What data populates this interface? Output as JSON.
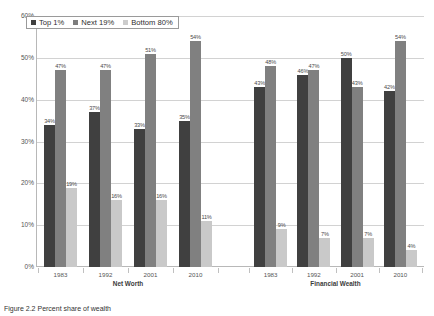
{
  "chart_data": {
    "type": "bar",
    "title": "",
    "xlabel": "",
    "ylabel": "",
    "ylim": [
      0,
      60
    ],
    "grid": true,
    "legend_position": "top-left",
    "yticks": [
      "0%",
      "10%",
      "20%",
      "30%",
      "40%",
      "50%",
      "60%"
    ],
    "ytick_values": [
      0,
      10,
      20,
      30,
      40,
      50,
      60
    ],
    "legend": [
      "Top 1%",
      "Next 19%",
      "Bottom 80%"
    ],
    "groups": [
      {
        "name": "Net Worth",
        "categories": [
          "1983",
          "1992",
          "2001",
          "2010"
        ],
        "series": [
          {
            "name": "Top 1%",
            "values": [
              34,
              37,
              33,
              35
            ],
            "labels": [
              "34%",
              "37%",
              "33%",
              "35%"
            ]
          },
          {
            "name": "Next 19%",
            "values": [
              47,
              47,
              51,
              54
            ],
            "labels": [
              "47%",
              "47%",
              "51%",
              "54%"
            ]
          },
          {
            "name": "Bottom 80%",
            "values": [
              19,
              16,
              16,
              11
            ],
            "labels": [
              "19%",
              "16%",
              "16%",
              "11%"
            ]
          }
        ]
      },
      {
        "name": "Financial Wealth",
        "categories": [
          "1983",
          "1992",
          "2001",
          "2010"
        ],
        "series": [
          {
            "name": "Top 1%",
            "values": [
              43,
              46,
              50,
              42
            ],
            "labels": [
              "43%",
              "46%",
              "50%",
              "42%"
            ]
          },
          {
            "name": "Next 19%",
            "values": [
              48,
              47,
              43,
              54
            ],
            "labels": [
              "48%",
              "47%",
              "43%",
              "54%"
            ]
          },
          {
            "name": "Bottom 80%",
            "values": [
              9,
              7,
              7,
              4
            ],
            "labels": [
              "9%",
              "7%",
              "7%",
              "4%"
            ]
          }
        ]
      }
    ],
    "colors": {
      "top1": "#404040",
      "next19": "#808080",
      "bottom80": "#c9c9c9",
      "gridline": "#d2d2d2",
      "axis": "#b8b8b8"
    }
  },
  "caption": {
    "text": "Figure 2.2   Percent share of wealth"
  }
}
